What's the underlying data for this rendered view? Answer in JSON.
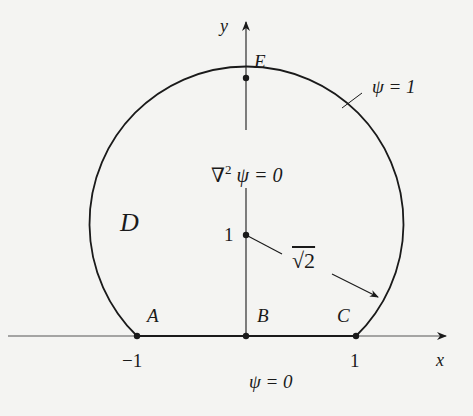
{
  "diagram": {
    "axes": {
      "x_label": "x",
      "y_label": "y"
    },
    "points": {
      "A": "A",
      "B": "B",
      "C": "C",
      "E": "E"
    },
    "ticks": {
      "x_neg": "−1",
      "x_pos": "1",
      "y_center": "1"
    },
    "region_label": "D",
    "equation": "∇² ψ = 0",
    "equation_parts": {
      "nabla": "∇",
      "sup": "2",
      "rest": " ψ = 0"
    },
    "boundary_top": "ψ = 1",
    "boundary_bottom": "ψ = 0",
    "radius_label": "√2",
    "colors": {
      "ink": "#1a1a1a",
      "background": "#f4f4f2"
    }
  }
}
